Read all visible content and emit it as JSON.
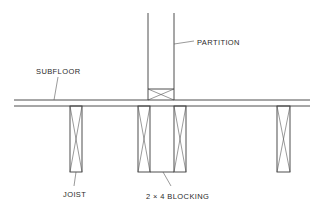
{
  "diagram": {
    "labels": {
      "partition": "PARTITION",
      "subfloor": "SUBFLOOR",
      "joist": "JOIST",
      "blocking": "2 × 4 BLOCKING"
    },
    "colors": {
      "line": "#3a3a3a",
      "background": "#ffffff"
    }
  }
}
